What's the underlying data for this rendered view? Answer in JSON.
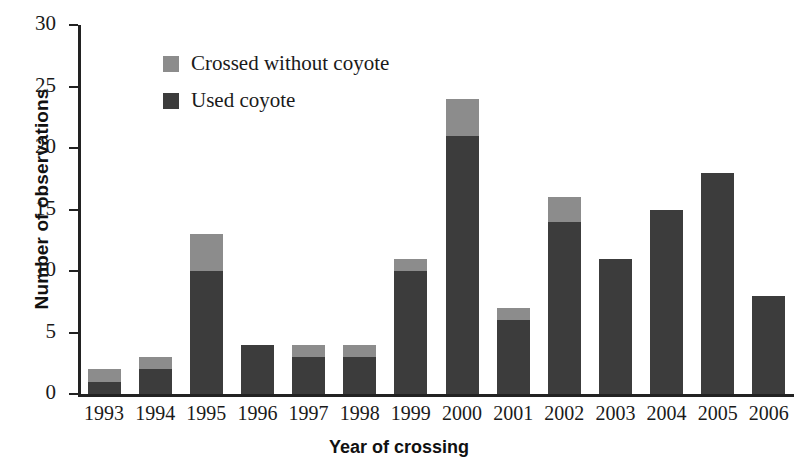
{
  "chart_data": {
    "type": "bar",
    "title": "",
    "subtitle": "",
    "xlabel": "Year of crossing",
    "ylabel": "Number of observations",
    "stacked": true,
    "grid": false,
    "legend_position": "inside-top-left",
    "ylim": [
      0,
      30
    ],
    "yticks": [
      0,
      5,
      10,
      15,
      20,
      25,
      30
    ],
    "ytick_labels": [
      "0",
      "5",
      "10",
      "15",
      "20",
      "25",
      "30"
    ],
    "categories": [
      "1993",
      "1994",
      "1995",
      "1996",
      "1997",
      "1998",
      "1999",
      "2000",
      "2001",
      "2002",
      "2003",
      "2004",
      "2005",
      "2006"
    ],
    "series": [
      {
        "name": "Used coyote",
        "color": "#3c3c3c",
        "values": [
          1,
          2,
          10,
          4,
          3,
          3,
          10,
          21,
          6,
          14,
          11,
          15,
          18,
          8
        ]
      },
      {
        "name": "Crossed without coyote",
        "color": "#8c8c8c",
        "values": [
          1,
          1,
          3,
          0,
          1,
          1,
          1,
          3,
          1,
          2,
          0,
          0,
          0,
          0
        ]
      }
    ],
    "totals": [
      2,
      3,
      13,
      4,
      4,
      4,
      11,
      24,
      7,
      16,
      11,
      15,
      18,
      8
    ]
  },
  "legend": {
    "items": [
      {
        "label": "Crossed without coyote",
        "swatch": "light-gray-square"
      },
      {
        "label": "Used coyote",
        "swatch": "dark-gray-square"
      }
    ]
  },
  "axes": {
    "y_title": "Number of observations",
    "x_title": "Year of crossing"
  }
}
